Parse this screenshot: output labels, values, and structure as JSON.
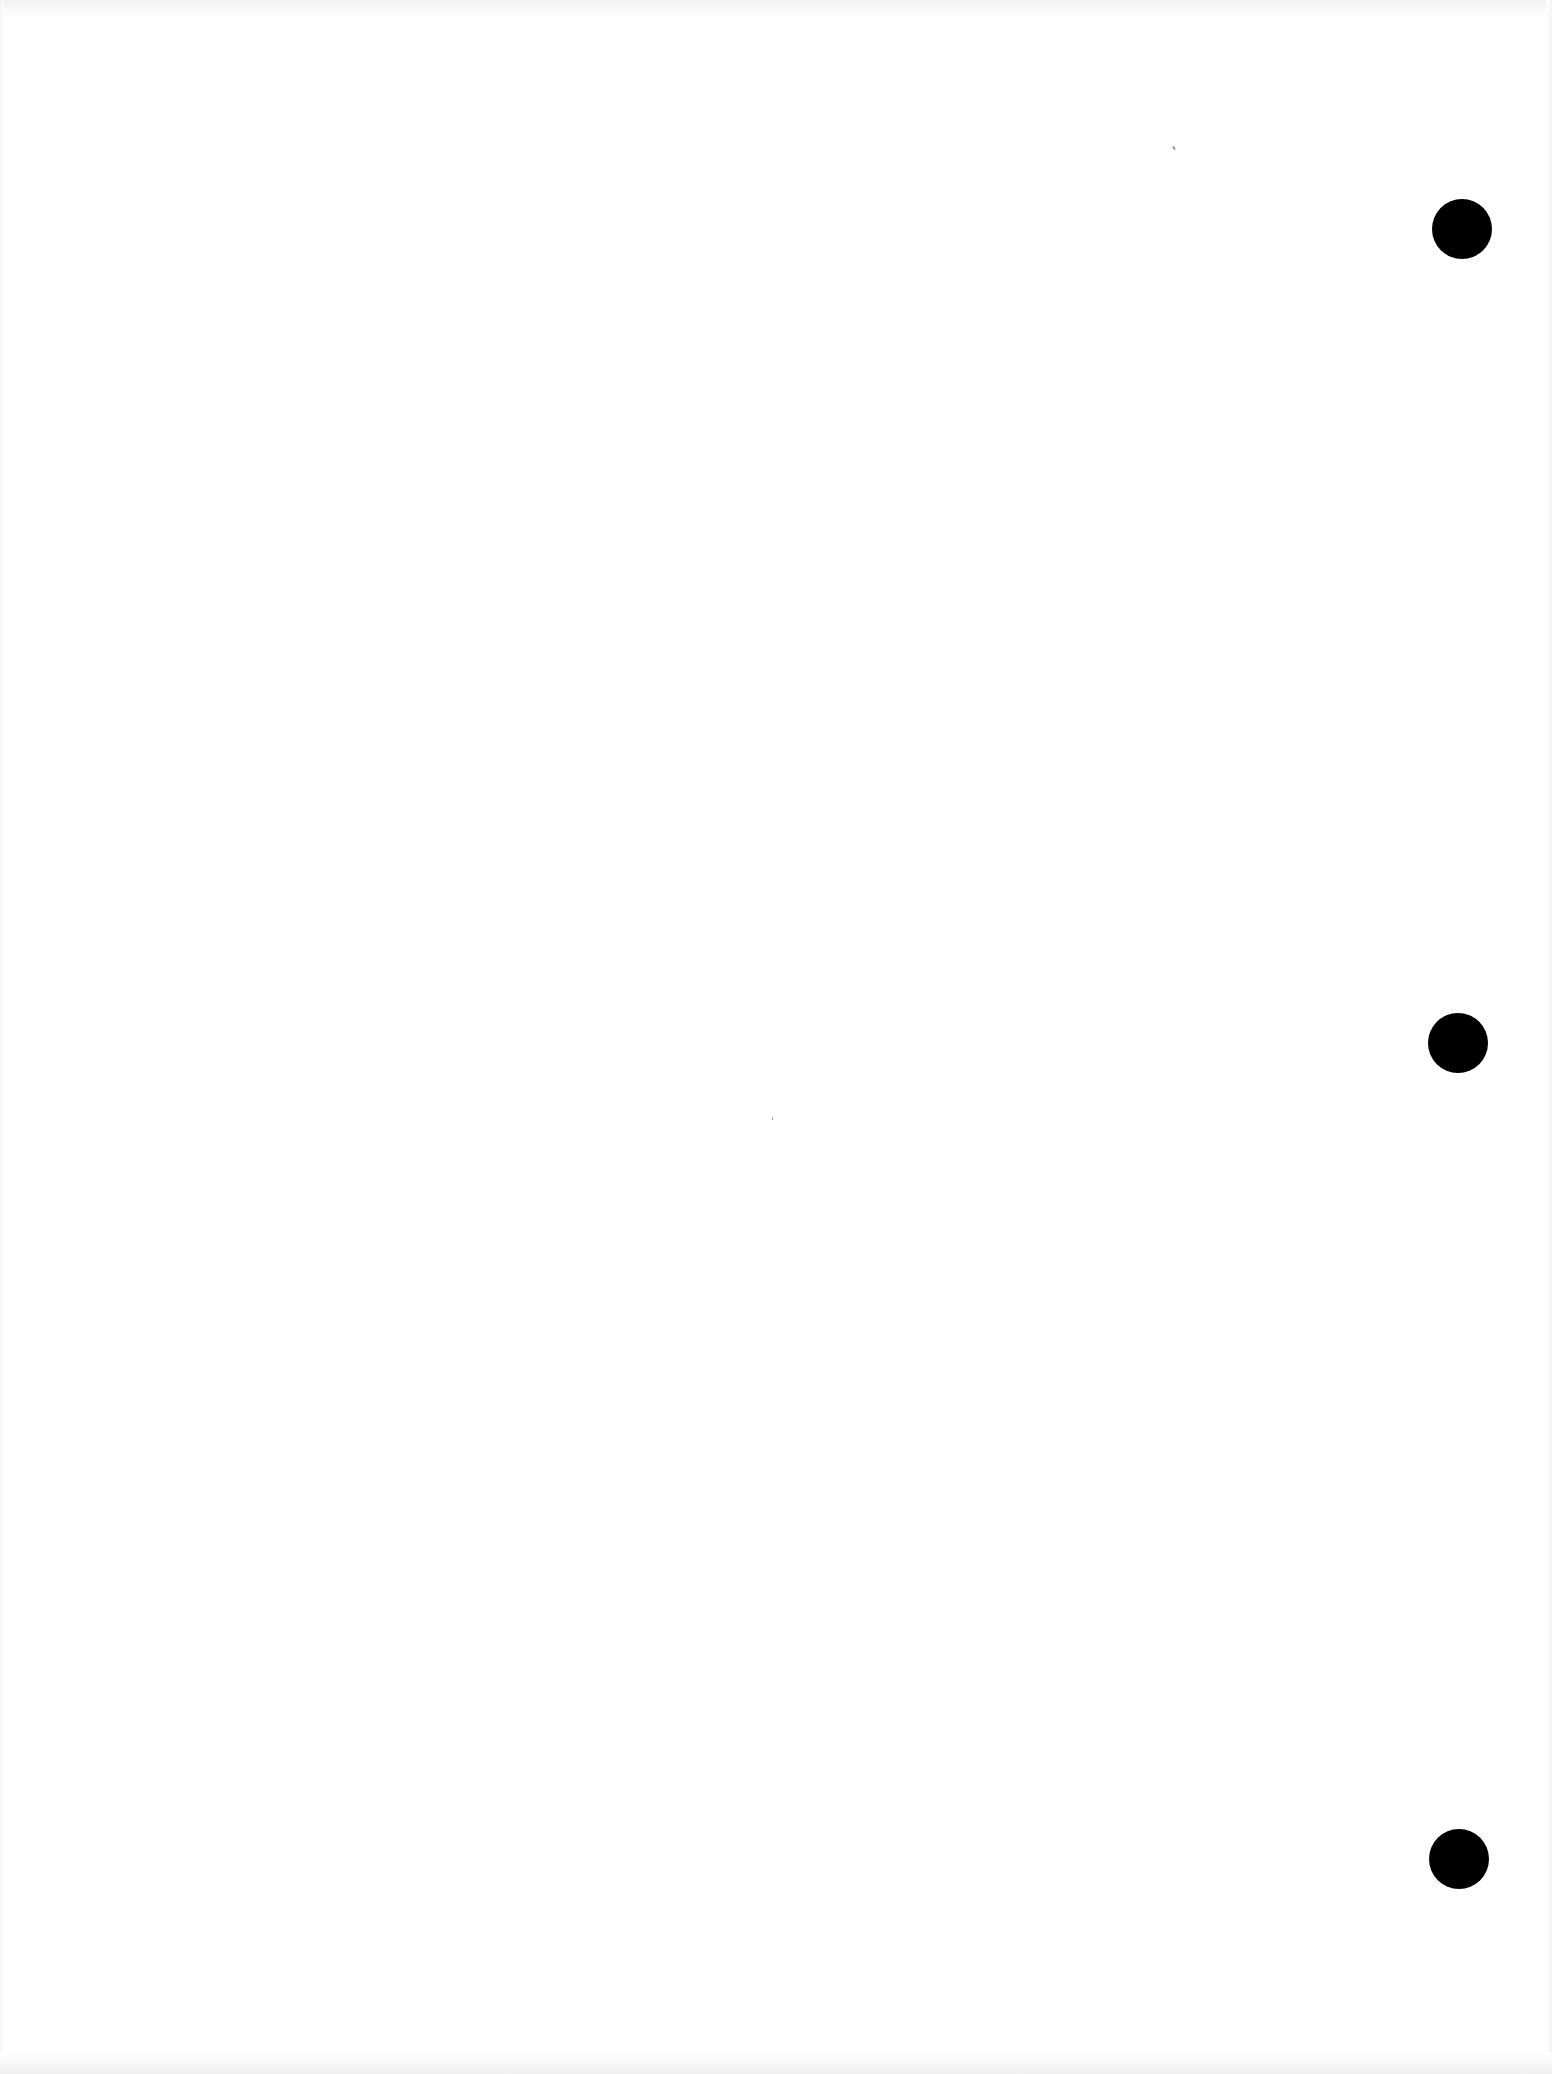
{
  "page": {
    "type": "blank scanned sheet",
    "background_color": "#ffffff",
    "text_content": ""
  },
  "punch_holes": [
    {
      "position": "top",
      "cx": 1462,
      "cy": 229,
      "diameter": 60,
      "color": "#000000"
    },
    {
      "position": "middle",
      "cx": 1458,
      "cy": 1043,
      "diameter": 60,
      "color": "#000000"
    },
    {
      "position": "bottom",
      "cx": 1459,
      "cy": 1859,
      "diameter": 60,
      "color": "#000000"
    }
  ]
}
